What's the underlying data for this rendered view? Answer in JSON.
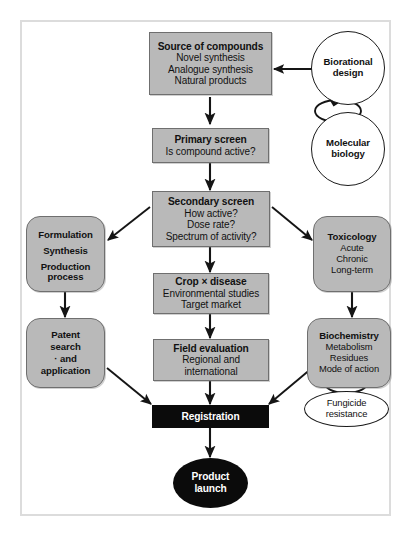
{
  "diagram": {
    "colors": {
      "box_fill": "#b9b9b9",
      "box_border": "#6f6f6f",
      "accent_black": "#0b0b0b",
      "frame": "#dcdcdc",
      "text": "#111111",
      "inverse_text": "#ffffff"
    },
    "nodes": {
      "source_of_compounds": {
        "heading": "Source of compounds",
        "lines": [
          "Novel synthesis",
          "Analogue synthesis",
          "Natural products"
        ],
        "shape": "rectangle"
      },
      "primary_screen": {
        "heading": "Primary screen",
        "lines": [
          "Is compound active?"
        ],
        "shape": "rectangle"
      },
      "secondary_screen": {
        "heading": "Secondary screen",
        "lines": [
          "How active?",
          "Dose rate?",
          "Spectrum of activity?"
        ],
        "shape": "rectangle"
      },
      "crop_disease": {
        "heading": "Crop × disease",
        "lines": [
          "Environmental studies",
          "Target market"
        ],
        "shape": "rectangle"
      },
      "field_evaluation": {
        "heading": "Field evaluation",
        "lines": [
          "Regional and",
          "international"
        ],
        "shape": "rectangle"
      },
      "formulation": {
        "heading": "",
        "lines": [
          "Formulation",
          "Synthesis",
          "Production",
          "process"
        ],
        "shape": "rounded-rectangle"
      },
      "patent": {
        "heading": "",
        "lines": [
          "Patent",
          "search",
          "· and",
          "application"
        ],
        "shape": "rounded-rectangle"
      },
      "toxicology": {
        "heading": "Toxicology",
        "lines": [
          "Acute",
          "Chronic",
          "Long-term"
        ],
        "shape": "rounded-rectangle"
      },
      "biochemistry": {
        "heading": "Biochemistry",
        "lines": [
          "Metabolism",
          "Residues",
          "Mode of action"
        ],
        "shape": "rounded-rectangle"
      },
      "biorational_design": {
        "lines": [
          "Biorational",
          "design"
        ],
        "shape": "circle"
      },
      "molecular_biology": {
        "lines": [
          "Molecular",
          "biology"
        ],
        "shape": "circle"
      },
      "fungicide_resistance": {
        "lines": [
          "Fungicide",
          "resistance"
        ],
        "shape": "ellipse"
      },
      "registration": {
        "heading": "Registration",
        "shape": "black-bar"
      },
      "product_launch": {
        "lines": [
          "Product",
          "launch"
        ],
        "shape": "black-ellipse"
      }
    }
  }
}
